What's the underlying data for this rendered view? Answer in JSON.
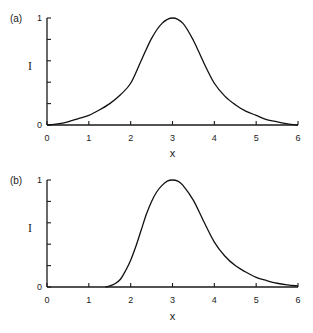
{
  "chart_data": [
    {
      "type": "line",
      "panel_label": "(a)",
      "xlabel": "x",
      "ylabel": "I",
      "xlim": [
        0,
        6
      ],
      "ylim": [
        0,
        1
      ],
      "x_ticks": [
        0,
        1,
        2,
        3,
        4,
        5,
        6
      ],
      "x_tick_labels": [
        "0",
        "1",
        "2",
        "3",
        "4",
        "5",
        "6"
      ],
      "y_ticks": [
        0,
        0.2,
        0.4,
        0.6,
        0.8,
        1
      ],
      "y_tick_labels": [
        "0",
        "",
        "",
        "",
        "",
        "1"
      ],
      "grid": false,
      "series": [
        {
          "name": "I(x)",
          "x": [
            0,
            0.25,
            0.5,
            0.75,
            1,
            1.25,
            1.5,
            1.75,
            2,
            2.25,
            2.5,
            2.75,
            3,
            3.25,
            3.5,
            3.75,
            4,
            4.25,
            4.5,
            4.75,
            5,
            5.25,
            5.5,
            5.75,
            6
          ],
          "y": [
            0,
            0.01,
            0.03,
            0.06,
            0.09,
            0.14,
            0.2,
            0.28,
            0.39,
            0.6,
            0.81,
            0.95,
            1.0,
            0.95,
            0.79,
            0.58,
            0.39,
            0.27,
            0.19,
            0.13,
            0.09,
            0.05,
            0.03,
            0.01,
            0
          ]
        }
      ]
    },
    {
      "type": "line",
      "panel_label": "(b)",
      "xlabel": "x",
      "ylabel": "I",
      "xlim": [
        0,
        6
      ],
      "ylim": [
        0,
        1
      ],
      "x_ticks": [
        0,
        1,
        2,
        3,
        4,
        5,
        6
      ],
      "x_tick_labels": [
        "0",
        "1",
        "2",
        "3",
        "4",
        "5",
        "6"
      ],
      "y_ticks": [
        0,
        0.2,
        0.4,
        0.6,
        0.8,
        1
      ],
      "y_tick_labels": [
        "0",
        "",
        "",
        "",
        "",
        "1"
      ],
      "grid": false,
      "series": [
        {
          "name": "I(x)",
          "x": [
            1.4,
            1.5,
            1.625,
            1.75,
            1.875,
            2,
            2.125,
            2.25,
            2.375,
            2.5,
            2.625,
            2.75,
            2.875,
            3,
            3.125,
            3.25,
            3.5,
            3.75,
            4,
            4.25,
            4.5,
            4.75,
            5,
            5.25,
            5.5,
            5.75,
            6
          ],
          "y": [
            0,
            0.01,
            0.03,
            0.07,
            0.15,
            0.25,
            0.38,
            0.53,
            0.68,
            0.8,
            0.89,
            0.95,
            0.99,
            1.0,
            0.99,
            0.95,
            0.81,
            0.61,
            0.42,
            0.29,
            0.2,
            0.14,
            0.09,
            0.06,
            0.035,
            0.02,
            0.01
          ]
        }
      ]
    }
  ]
}
